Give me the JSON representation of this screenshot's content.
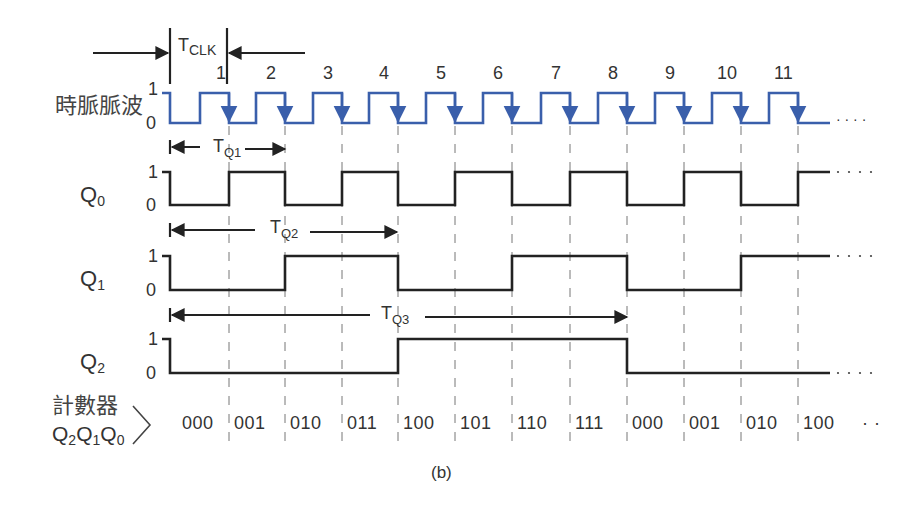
{
  "caption": "(b)",
  "colors": {
    "clock": "#3a5fab",
    "signal": "#222222",
    "grid": "#777777",
    "text": "#333333"
  },
  "clock": {
    "label": "時脈脈波",
    "level_high": "1",
    "level_low": "0",
    "pulse_numbers": [
      "1",
      "2",
      "3",
      "4",
      "5",
      "6",
      "7",
      "8",
      "9",
      "10",
      "11"
    ],
    "continuation": "· · · ·"
  },
  "period_marker": {
    "label_main": "T",
    "label_sub": "CLK"
  },
  "signals": [
    {
      "name": "Q",
      "sub": "0",
      "high": "1",
      "low": "0",
      "period_label_main": "T",
      "period_label_sub": "Q1",
      "values": [
        0,
        1,
        0,
        1,
        0,
        1,
        0,
        1,
        0,
        1,
        0,
        1
      ]
    },
    {
      "name": "Q",
      "sub": "1",
      "high": "1",
      "low": "0",
      "period_label_main": "T",
      "period_label_sub": "Q2",
      "values": [
        0,
        0,
        1,
        1,
        0,
        0,
        1,
        1,
        0,
        0,
        1,
        1
      ]
    },
    {
      "name": "Q",
      "sub": "2",
      "high": "1",
      "low": "0",
      "period_label_main": "T",
      "period_label_sub": "Q3",
      "values": [
        0,
        0,
        0,
        0,
        1,
        1,
        1,
        1,
        0,
        0,
        0,
        0
      ]
    }
  ],
  "counter": {
    "label_line1": "計數器",
    "label_line2_parts": [
      "Q",
      "2",
      "Q",
      "1",
      "Q",
      "0"
    ],
    "states": [
      "000",
      "001",
      "010",
      "011",
      "100",
      "101",
      "110",
      "111",
      "000",
      "001",
      "010",
      "100"
    ],
    "continuation": "· ·"
  }
}
